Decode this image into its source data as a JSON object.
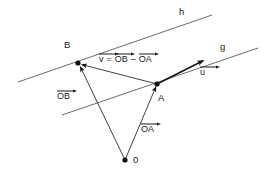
{
  "figure": {
    "background_color": "#ffffff",
    "stroke_color": "#1a1a1a",
    "line_color": "#555555",
    "labels": {
      "line_h": "h",
      "line_g": "g",
      "point_b": "B",
      "point_a": "A",
      "point_o": "0",
      "vec_u": "u",
      "vec_ob": "OB",
      "vec_oa": "OA",
      "eq_v": "v",
      "eq_equals": "=",
      "eq_ob": "OB",
      "eq_minus": "–",
      "eq_oa": "OA"
    },
    "geometry": {
      "point_o": [
        125,
        160
      ],
      "point_a": [
        157,
        84
      ],
      "point_b": [
        78,
        63
      ],
      "line_h": [
        [
          18,
          82
        ],
        [
          212,
          15
        ]
      ],
      "line_g": [
        [
          62,
          115
        ],
        [
          258,
          48
        ]
      ],
      "arrow_u_tip": [
        203,
        60
      ],
      "vectors": [
        {
          "name": "OA",
          "from": [
            125,
            160
          ],
          "to": [
            157,
            84
          ]
        },
        {
          "name": "OB",
          "from": [
            125,
            160
          ],
          "to": [
            78,
            63
          ]
        },
        {
          "name": "v",
          "from": [
            157,
            84
          ],
          "to": [
            78,
            63
          ]
        }
      ]
    }
  }
}
